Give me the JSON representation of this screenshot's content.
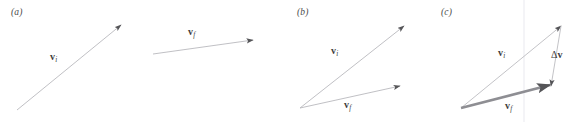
{
  "figure": {
    "width": 579,
    "height": 122,
    "background": "#ffffff",
    "colors": {
      "thin_stroke": "#b9b9bd",
      "thick_stroke": "#8e8e93",
      "arrowhead": "#555558",
      "label_text": "#3d3d3d",
      "panel_label_text": "#4a4a4a",
      "gridline": "#e8e8ee"
    }
  },
  "panels": [
    {
      "id": "a",
      "label": "(a)",
      "label_pos": {
        "x": 11,
        "y": 7
      },
      "caption_meaning": "separated vectors",
      "vectors": [
        {
          "name": "v-initial",
          "label_v": "v",
          "label_sub": "i",
          "label_pos": {
            "x": 50,
            "y": 52
          },
          "tail": {
            "x": 17,
            "y": 110
          },
          "tip": {
            "x": 121,
            "y": 25
          },
          "style": "thin"
        },
        {
          "name": "v-final",
          "label_v": "v",
          "label_sub": "f",
          "label_pos": {
            "x": 188,
            "y": 27
          },
          "tail": {
            "x": 153,
            "y": 54
          },
          "tip": {
            "x": 253,
            "y": 40
          },
          "style": "thin"
        }
      ]
    },
    {
      "id": "b",
      "label": "(b)",
      "label_pos": {
        "x": 297,
        "y": 7
      },
      "caption_meaning": "vectors drawn tail to tail",
      "vectors": [
        {
          "name": "v-initial",
          "label_v": "v",
          "label_sub": "i",
          "label_pos": {
            "x": 331,
            "y": 46
          },
          "tail": {
            "x": 300,
            "y": 108
          },
          "tip": {
            "x": 404,
            "y": 26
          },
          "style": "thin"
        },
        {
          "name": "v-final",
          "label_v": "v",
          "label_sub": "f",
          "label_pos": {
            "x": 344,
            "y": 100
          },
          "tail": {
            "x": 300,
            "y": 108
          },
          "tip": {
            "x": 400,
            "y": 86
          },
          "style": "thin"
        }
      ]
    },
    {
      "id": "c",
      "label": "(c)",
      "label_pos": {
        "x": 441,
        "y": 7
      },
      "caption_meaning": "difference vector delta-v closing the triangle",
      "gridline_x": 524,
      "vectors": [
        {
          "name": "v-initial",
          "label_v": "v",
          "label_sub": "i",
          "label_pos": {
            "x": 498,
            "y": 48
          },
          "tail": {
            "x": 461,
            "y": 108
          },
          "tip": {
            "x": 561,
            "y": 26
          },
          "style": "thin"
        },
        {
          "name": "v-final",
          "label_v": "v",
          "label_sub": "f",
          "label_pos": {
            "x": 505,
            "y": 101
          },
          "tail": {
            "x": 461,
            "y": 108
          },
          "tip": {
            "x": 550,
            "y": 85
          },
          "style": "thick"
        },
        {
          "name": "delta-v",
          "label_v": "v",
          "label_delta": "Δ",
          "label_sub": "",
          "label_pos": {
            "x": 551,
            "y": 50
          },
          "tail": {
            "x": 561,
            "y": 26
          },
          "tip": {
            "x": 551,
            "y": 86
          },
          "style": "thin"
        }
      ]
    }
  ]
}
